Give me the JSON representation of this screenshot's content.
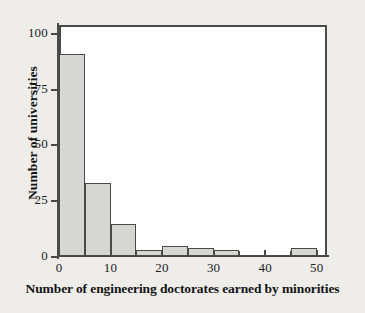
{
  "chart_data": {
    "type": "bar",
    "title": "",
    "subtitle": "",
    "xlabel": "Number of engineering doctorates earned by minorities",
    "ylabel": "Number of universities",
    "xlim": [
      0,
      52
    ],
    "ylim": [
      0,
      104
    ],
    "xticks": [
      0,
      10,
      20,
      30,
      40,
      50
    ],
    "xtick_labels": [
      "0",
      "10",
      "20",
      "30",
      "40",
      "50"
    ],
    "xticks_minor": [
      5,
      15,
      25,
      35,
      45
    ],
    "yticks": [
      0,
      25,
      50,
      75,
      100
    ],
    "ytick_labels": [
      "0",
      "25",
      "50",
      "75",
      "100"
    ],
    "grid": false,
    "legend": null,
    "bin_width": 5,
    "bins": [
      {
        "x0": 0,
        "x1": 5,
        "value": 91
      },
      {
        "x0": 5,
        "x1": 10,
        "value": 33
      },
      {
        "x0": 10,
        "x1": 15,
        "value": 15
      },
      {
        "x0": 15,
        "x1": 20,
        "value": 3
      },
      {
        "x0": 20,
        "x1": 25,
        "value": 5
      },
      {
        "x0": 25,
        "x1": 30,
        "value": 4
      },
      {
        "x0": 30,
        "x1": 35,
        "value": 3
      },
      {
        "x0": 35,
        "x1": 40,
        "value": 0
      },
      {
        "x0": 40,
        "x1": 45,
        "value": 0
      },
      {
        "x0": 45,
        "x1": 50,
        "value": 4
      }
    ],
    "categories": [
      "0-5",
      "5-10",
      "10-15",
      "15-20",
      "20-25",
      "25-30",
      "30-35",
      "35-40",
      "40-45",
      "45-50"
    ],
    "values": [
      91,
      33,
      15,
      3,
      5,
      4,
      3,
      0,
      0,
      4
    ],
    "colors": {
      "bar_fill": "#d6d6d4",
      "bar_edge": "#4a4a4a",
      "axis": "#4a4a4a",
      "plot_background": "#ffffff",
      "figure_background": "#eeedea",
      "text": "#141414"
    }
  }
}
